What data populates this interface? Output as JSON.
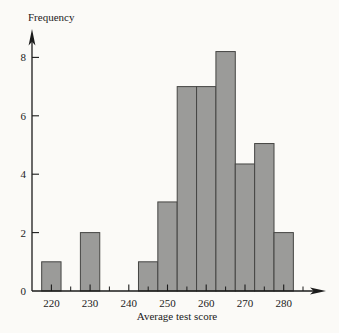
{
  "figure": {
    "background": "#fbfaf7"
  },
  "chart_data": {
    "type": "bar",
    "subtype": "histogram",
    "title": "",
    "xlabel": "Average test score",
    "ylabel": "Frequency",
    "bin_width": 5,
    "bin_centers": [
      220,
      225,
      230,
      235,
      240,
      245,
      250,
      255,
      260,
      265,
      270,
      275,
      280
    ],
    "frequencies": [
      1,
      0,
      2,
      0,
      0,
      1,
      3.05,
      7,
      7,
      8.2,
      4.35,
      5.05,
      2
    ],
    "x_ticks_major": [
      220,
      230,
      240,
      250,
      260,
      270,
      280
    ],
    "x_ticks_minor": [
      225,
      235,
      245,
      255,
      265,
      275,
      285
    ],
    "y_ticks": [
      0,
      2,
      4,
      6,
      8
    ],
    "xlim": [
      215,
      287
    ],
    "ylim": [
      0,
      9
    ],
    "grid": "off",
    "legend": "none",
    "bar_fill": "#9b9b99",
    "bar_stroke": "#454543",
    "axis_color": "#1b1b1b",
    "text_color": "#1b1b1b"
  }
}
